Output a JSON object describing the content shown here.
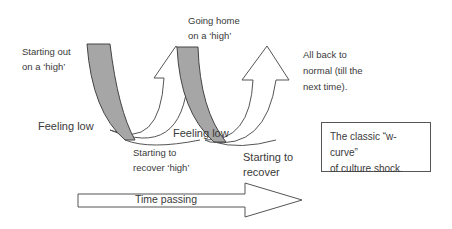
{
  "diagram": {
    "labels": {
      "starting_out_line1": "Starting out",
      "starting_out_line2": "on a ‘high’",
      "feeling_low_1": "Feeling low",
      "starting_recover_1_line1": "Starting  to",
      "starting_recover_1_line2": "recover ‘high’",
      "going_home_line1": "Going home",
      "going_home_line2": "on a ‘high’",
      "feeling_low_2": "Feeling low",
      "starting_recover_2_line1": "Starting to",
      "starting_recover_2_line2": "recover",
      "all_back_line1": "All back to",
      "all_back_line2": "normal (till the",
      "all_back_line3": "next time)."
    },
    "caption": {
      "line1": "The classic “w-curve”",
      "line2": "of culture shock."
    },
    "time_arrow": {
      "label": "Time passing"
    },
    "colors": {
      "band_fill": "#a6a6a6",
      "outline": "#444444",
      "arrow_fill": "#ffffff"
    }
  }
}
